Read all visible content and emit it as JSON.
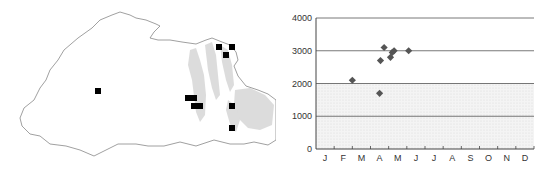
{
  "map": {
    "description": "Distribution map with collection localities",
    "marker_color": "#000000",
    "outline_color": "#888888",
    "relief_color": "#d6d6d6",
    "markers": [
      {
        "x": 98,
        "y": 91
      },
      {
        "x": 219,
        "y": 47
      },
      {
        "x": 232,
        "y": 47
      },
      {
        "x": 226,
        "y": 55
      },
      {
        "x": 188,
        "y": 98
      },
      {
        "x": 194,
        "y": 98
      },
      {
        "x": 194,
        "y": 106
      },
      {
        "x": 200,
        "y": 106
      },
      {
        "x": 232,
        "y": 106
      },
      {
        "x": 232,
        "y": 128
      }
    ]
  },
  "chart_data": {
    "type": "scatter",
    "title": "",
    "xlabel": "",
    "ylabel": "",
    "x_categories": [
      "J",
      "F",
      "M",
      "A",
      "M",
      "J",
      "J",
      "A",
      "S",
      "O",
      "N",
      "D"
    ],
    "y_ticks": [
      0,
      1000,
      2000,
      3000,
      4000
    ],
    "ylim": [
      0,
      4000
    ],
    "grid": "horizontal",
    "marker": "diamond",
    "marker_color": "#555555",
    "points": [
      {
        "month": 2.0,
        "value": 2100
      },
      {
        "month": 3.5,
        "value": 1700
      },
      {
        "month": 3.55,
        "value": 2700
      },
      {
        "month": 3.75,
        "value": 3100
      },
      {
        "month": 4.1,
        "value": 2800
      },
      {
        "month": 4.2,
        "value": 2950
      },
      {
        "month": 4.3,
        "value": 3000
      },
      {
        "month": 5.1,
        "value": 3000
      }
    ]
  }
}
